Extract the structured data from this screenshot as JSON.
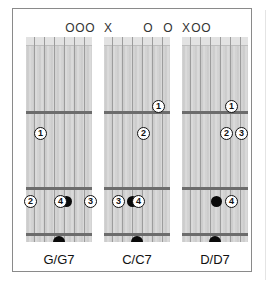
{
  "colors": {
    "border": "#8a8a8a",
    "fret": "#6c6c6c",
    "finger_stroke": "#111111",
    "dot": "#0a0a0a"
  },
  "chords": [
    {
      "label": "G/G7",
      "markers": [
        {
          "string": 4,
          "symbol": "O"
        },
        {
          "string": 5,
          "symbol": "O"
        },
        {
          "string": 6,
          "symbol": "O"
        }
      ],
      "fingers": [
        {
          "num": "1",
          "string": 1,
          "fret": 1
        },
        {
          "num": "2",
          "string": 0,
          "fret": 2
        },
        {
          "num": "4",
          "string": 3,
          "fret": 2
        },
        {
          "num": "3",
          "string": 6,
          "fret": 2
        }
      ],
      "dots": [
        {
          "string": 3.6,
          "fret": 2
        }
      ],
      "bottom_half_dot": true
    },
    {
      "label": "C/C7",
      "markers": [
        {
          "string": 0,
          "symbol": "X"
        },
        {
          "string": 4,
          "symbol": "O"
        },
        {
          "string": 6,
          "symbol": "O"
        }
      ],
      "fingers": [
        {
          "num": "1",
          "string": 5,
          "fret": 0.6
        },
        {
          "num": "2",
          "string": 3.5,
          "fret": 1
        },
        {
          "num": "3",
          "string": 1,
          "fret": 2
        },
        {
          "num": "4",
          "string": 3,
          "fret": 2
        }
      ],
      "dots": [
        {
          "string": 2.4,
          "fret": 2
        }
      ],
      "bottom_half_dot": true
    },
    {
      "label": "D/D7",
      "markers": [
        {
          "string": 0,
          "symbol": "X"
        },
        {
          "string": 1,
          "symbol": "O"
        },
        {
          "string": 2,
          "symbol": "O"
        }
      ],
      "fingers": [
        {
          "num": "1",
          "string": 4.5,
          "fret": 0.6
        },
        {
          "num": "2",
          "string": 4,
          "fret": 1
        },
        {
          "num": "3",
          "string": 5.5,
          "fret": 1
        },
        {
          "num": "4",
          "string": 4.5,
          "fret": 2
        }
      ],
      "dots": [
        {
          "string": 3,
          "fret": 2
        }
      ],
      "bottom_half_dot": true
    }
  ]
}
